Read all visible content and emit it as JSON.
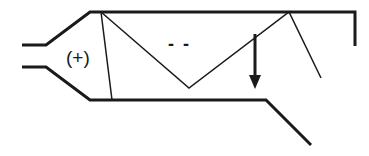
{
  "diagram": {
    "labels": {
      "positive_region": "(+)",
      "negative_region": "- -"
    },
    "colors": {
      "stroke": "#1a1a1a",
      "background": "#ffffff"
    },
    "elements": {
      "inlet": "converging-inlet-walls",
      "channel": "upper-and-lower-walls",
      "zigzag": "reflected-wave-lines",
      "arrow": "downward-arrow",
      "outlet": "diverging-lower-wall",
      "end_cap": "right-vertical-wall"
    }
  }
}
